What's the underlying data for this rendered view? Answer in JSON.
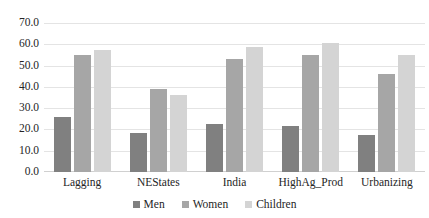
{
  "chart_data": {
    "type": "bar",
    "title": "",
    "subtitle": "",
    "xlabel": "",
    "ylabel": "",
    "categories": [
      "Lagging",
      "NEStates",
      "India",
      "HighAg_Prod",
      "Urbanizing"
    ],
    "series": [
      {
        "name": "Men",
        "color": "#808080",
        "values": [
          26.0,
          18.5,
          22.5,
          21.5,
          17.5
        ]
      },
      {
        "name": "Women",
        "color": "#a6a6a6",
        "values": [
          55.0,
          39.0,
          53.0,
          55.0,
          46.0
        ]
      },
      {
        "name": "Children",
        "color": "#d4d4d4",
        "values": [
          57.5,
          36.0,
          58.5,
          60.5,
          55.0
        ]
      }
    ],
    "ylim": [
      0.0,
      70.0
    ],
    "ytick_step": 10.0,
    "yticks": [
      "0.0",
      "10.0",
      "20.0",
      "30.0",
      "40.0",
      "50.0",
      "60.0",
      "70.0"
    ],
    "ytick_values": [
      0.0,
      10.0,
      20.0,
      30.0,
      40.0,
      50.0,
      60.0,
      70.0
    ],
    "grid": true,
    "grid_axis": "y",
    "legend_position": "bottom",
    "legend_entries": [
      "Men",
      "Women",
      "Children"
    ],
    "annotations": []
  }
}
